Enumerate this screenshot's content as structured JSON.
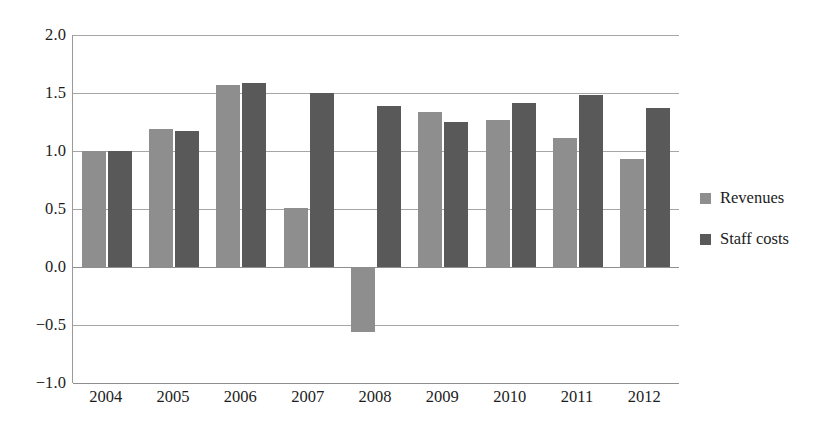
{
  "chart_data": {
    "type": "bar",
    "title": "",
    "subtitle": "",
    "xlabel": "",
    "ylabel": "",
    "categories": [
      "2004",
      "2005",
      "2006",
      "2007",
      "2008",
      "2009",
      "2010",
      "2011",
      "2012"
    ],
    "series": [
      {
        "name": "Revenues",
        "color": "#8e8e8e",
        "values": [
          1.0,
          1.19,
          1.57,
          0.51,
          -0.56,
          1.34,
          1.27,
          1.11,
          0.93
        ]
      },
      {
        "name": "Staff costs",
        "color": "#595959",
        "values": [
          1.0,
          1.17,
          1.59,
          1.5,
          1.39,
          1.25,
          1.41,
          1.48,
          1.37
        ]
      }
    ],
    "ylim": [
      -1.0,
      2.0
    ],
    "yticks": [
      "2.0",
      "1.5",
      "1.0",
      "0.5",
      "0.0",
      "-0.5",
      "-1.0"
    ],
    "ytick_values": [
      2.0,
      1.5,
      1.0,
      0.5,
      0.0,
      -0.5,
      -1.0
    ],
    "grid": true,
    "grid_axis": "y",
    "legend_position": "right",
    "annotations": []
  },
  "colors": {
    "revenues": "#8e8e8e",
    "staff_costs": "#595959",
    "gridline": "#a6a6a6",
    "axis": "#8f8f8f",
    "text": "#1c1c1c",
    "background": "#ffffff"
  }
}
